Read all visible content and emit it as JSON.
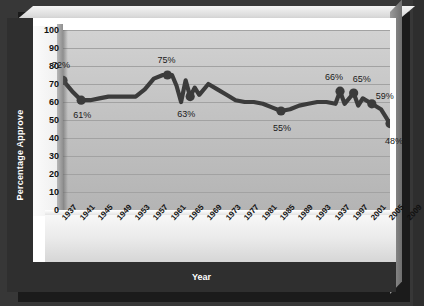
{
  "figure": {
    "x_axis_title": "Year",
    "y_axis_title": "Percentage Approve",
    "line_color": "#3b3b3b",
    "plot_background": "#c5c5c5",
    "frame_color": "#2f2f2f"
  },
  "chart_data": {
    "type": "line",
    "title": "",
    "xlabel": "Year",
    "ylabel": "Percentage Approve",
    "ylim": [
      0,
      100
    ],
    "ytick_step": 10,
    "grid": true,
    "legend": "none",
    "yticks": [
      "100",
      "90",
      "80",
      "70",
      "60",
      "50",
      "40",
      "30",
      "20",
      "10",
      "0"
    ],
    "xticks": [
      "1937",
      "1941",
      "1945",
      "1949",
      "1953",
      "1957",
      "1961",
      "1965",
      "1969",
      "1973",
      "1977",
      "1981",
      "1985",
      "1989",
      "1993",
      "1937",
      "1997",
      "2001",
      "2005",
      "2009"
    ],
    "x": [
      1937,
      1939,
      1941,
      1943,
      1945,
      1947,
      1949,
      1951,
      1953,
      1955,
      1957,
      1959,
      1961,
      1962,
      1963,
      1964,
      1965,
      1966,
      1967,
      1969,
      1971,
      1973,
      1975,
      1977,
      1979,
      1981,
      1983,
      1985,
      1987,
      1989,
      1991,
      1993,
      1995,
      1997,
      1998,
      1999,
      2001,
      2002,
      2003,
      2005,
      2007,
      2009
    ],
    "values": [
      72,
      66,
      61,
      61,
      62,
      63,
      63,
      63,
      63,
      67,
      73,
      75,
      75,
      69,
      60,
      72,
      63,
      68,
      64,
      70,
      67,
      64,
      61,
      60,
      60,
      59,
      57,
      55,
      56,
      58,
      59,
      60,
      60,
      59,
      66,
      59,
      65,
      58,
      62,
      59,
      56,
      48
    ],
    "point_labels": [
      {
        "year": 1937,
        "value": 72,
        "text": "72%"
      },
      {
        "year": 1941,
        "value": 61,
        "text": "61%"
      },
      {
        "year": 1960,
        "value": 75,
        "text": "75%"
      },
      {
        "year": 1965,
        "value": 63,
        "text": "63%"
      },
      {
        "year": 1985,
        "value": 55,
        "text": "55%"
      },
      {
        "year": 1998,
        "value": 66,
        "text": "66%"
      },
      {
        "year": 2001,
        "value": 65,
        "text": "65%"
      },
      {
        "year": 2005,
        "value": 59,
        "text": "59%"
      },
      {
        "year": 2009,
        "value": 48,
        "text": "48%"
      }
    ]
  }
}
